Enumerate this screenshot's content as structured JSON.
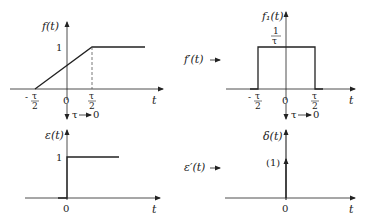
{
  "diagram": {
    "panels": [
      {
        "id": "top-left",
        "y_label": "f(t)",
        "x_label": "t",
        "level_label": "1",
        "ticks": {
          "left": "τ",
          "left_sign": "-",
          "origin": "0",
          "right": "τ",
          "denominator": "2"
        }
      },
      {
        "id": "top-right",
        "y_label": "f₁(t)",
        "x_label": "t",
        "level_num": "1",
        "level_den": "τ",
        "side_label": "f′(t)",
        "ticks": {
          "left": "τ",
          "left_sign": "-",
          "origin": "0",
          "right": "τ",
          "denominator": "2"
        }
      },
      {
        "id": "bottom-left",
        "y_label": "ε(t)",
        "x_label": "t",
        "level_label": "1",
        "ticks": {
          "origin": "0"
        }
      },
      {
        "id": "bottom-right",
        "y_label": "δ(t)",
        "x_label": "t",
        "impulse_weight": "(1)",
        "side_label": "ε′(t)",
        "ticks": {
          "origin": "0"
        }
      }
    ],
    "limit_arrows": [
      {
        "label": "τ",
        "target": "0"
      },
      {
        "label": "τ",
        "target": "0"
      }
    ]
  }
}
